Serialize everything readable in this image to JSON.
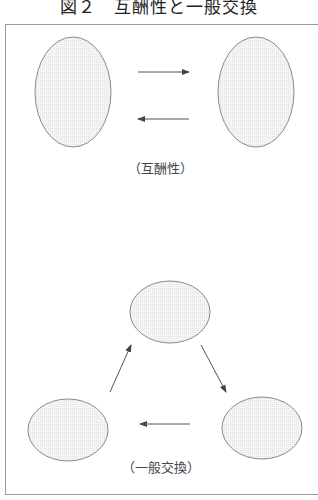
{
  "figure": {
    "title": "図２　互酬性と一般交換",
    "reciprocity_label": "（互酬性）",
    "general_exchange_label": "（一般交換）"
  },
  "colors": {
    "frame": "#9a9a9a",
    "ellipse_stroke": "#8a8a8a",
    "ellipse_fill": "#f1f1f1",
    "arrow": "#555555"
  },
  "diagram": {
    "reciprocity": {
      "nodes": [
        {
          "id": "A",
          "cx": 73,
          "cy": 92,
          "rx": 38,
          "ry": 55
        },
        {
          "id": "B",
          "cx": 256,
          "cy": 92,
          "rx": 38,
          "ry": 55
        }
      ],
      "edges": [
        {
          "from": "A",
          "to": "B"
        },
        {
          "from": "B",
          "to": "A"
        }
      ]
    },
    "general_exchange": {
      "nodes": [
        {
          "id": "top",
          "cx": 170,
          "cy": 312,
          "rx": 40,
          "ry": 31
        },
        {
          "id": "left",
          "cx": 68,
          "cy": 430,
          "rx": 40,
          "ry": 31
        },
        {
          "id": "right",
          "cx": 262,
          "cy": 428,
          "rx": 40,
          "ry": 31
        }
      ],
      "edges": [
        {
          "from": "left",
          "to": "top"
        },
        {
          "from": "top",
          "to": "right"
        },
        {
          "from": "right",
          "to": "left"
        }
      ]
    }
  }
}
